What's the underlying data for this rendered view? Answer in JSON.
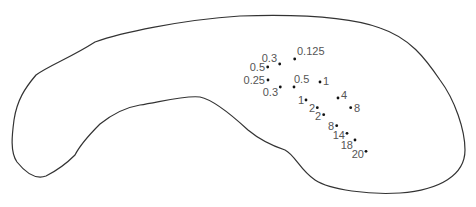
{
  "diagram": {
    "type": "outline-with-labeled-points",
    "outline_color": "#333333",
    "point_color": "#111111",
    "label_color": "#555555",
    "points": [
      {
        "label": "0.125",
        "x": 294.7,
        "y": 59,
        "lx": 297,
        "ly": 55,
        "anchor": "start"
      },
      {
        "label": "0.3",
        "x": 279.7,
        "y": 64,
        "lx": 277,
        "ly": 62,
        "anchor": "end"
      },
      {
        "label": "0.5",
        "x": 267.7,
        "y": 67,
        "lx": 265,
        "ly": 71,
        "anchor": "end"
      },
      {
        "label": "0.25",
        "x": 268,
        "y": 80,
        "lx": 265,
        "ly": 84,
        "anchor": "end"
      },
      {
        "label": "0.3",
        "x": 280.3,
        "y": 87,
        "lx": 278,
        "ly": 96,
        "anchor": "end"
      },
      {
        "label": "0.5",
        "x": 294,
        "y": 87,
        "lx": 294,
        "ly": 83,
        "anchor": "start"
      },
      {
        "label": "1",
        "x": 320,
        "y": 82,
        "lx": 323,
        "ly": 85,
        "anchor": "start"
      },
      {
        "label": "1",
        "x": 306,
        "y": 100,
        "lx": 304,
        "ly": 104,
        "anchor": "end"
      },
      {
        "label": "4",
        "x": 338,
        "y": 98,
        "lx": 341,
        "ly": 99,
        "anchor": "start"
      },
      {
        "label": "8",
        "x": 350.7,
        "y": 107.7,
        "lx": 354,
        "ly": 112,
        "anchor": "start"
      },
      {
        "label": "2",
        "x": 317.3,
        "y": 107.7,
        "lx": 315,
        "ly": 112,
        "anchor": "end"
      },
      {
        "label": "2",
        "x": 323.7,
        "y": 114.7,
        "lx": 321,
        "ly": 120,
        "anchor": "end"
      },
      {
        "label": "8",
        "x": 336.7,
        "y": 125.7,
        "lx": 334,
        "ly": 130,
        "anchor": "end"
      },
      {
        "label": "14",
        "x": 347,
        "y": 133.3,
        "lx": 345,
        "ly": 139,
        "anchor": "end"
      },
      {
        "label": "18",
        "x": 355,
        "y": 140,
        "lx": 353,
        "ly": 149,
        "anchor": "end"
      },
      {
        "label": "20",
        "x": 366,
        "y": 151.3,
        "lx": 364,
        "ly": 158,
        "anchor": "end"
      }
    ]
  }
}
